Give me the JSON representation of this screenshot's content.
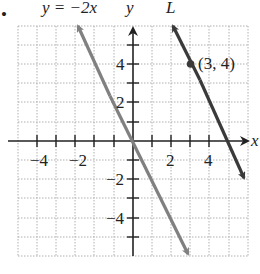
{
  "bullet": "•",
  "labels": {
    "line1_equation": "y = −2x",
    "y_axis": "y",
    "x_axis": "x",
    "line2_name": "L",
    "point": "(3, 4)"
  },
  "axes": {
    "x_ticks": [
      "−4",
      "−2",
      "2",
      "4"
    ],
    "y_ticks": [
      "4",
      "2",
      "−2",
      "−4"
    ],
    "xlim": [
      -6,
      6
    ],
    "ylim": [
      -6,
      6
    ]
  },
  "lines": [
    {
      "name": "y = −2x",
      "slope": -2,
      "intercept": 0,
      "color": "#808080"
    },
    {
      "name": "L",
      "slope": -2,
      "intercept": 10,
      "color": "#3a3a3a",
      "point": [
        3,
        4
      ]
    }
  ],
  "colors": {
    "grid": "#b0b0b0",
    "axis": "#222222"
  }
}
